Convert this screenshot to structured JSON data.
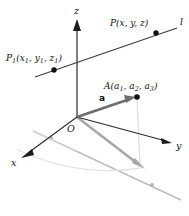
{
  "figure": {
    "colors": {
      "axis": "#2b2b2b",
      "line": "#3a3a3a",
      "vector": "#6e6e6e",
      "projection": "#b9b9b9",
      "projection_light": "#d8d8d8",
      "point": "#111111",
      "point_gray": "#b0b0b0",
      "background": "#ffffff"
    },
    "axes": [
      {
        "id": "x",
        "label": "x",
        "label_x": 12,
        "label_y": 163,
        "from": [
          77,
          117
        ],
        "to": [
          22,
          157
        ]
      },
      {
        "id": "y",
        "label": "y",
        "label_x": 176,
        "label_y": 148,
        "from": [
          77,
          117
        ],
        "to": [
          169,
          142
        ]
      },
      {
        "id": "z",
        "label": "z",
        "label_x": 74,
        "label_y": 10,
        "from": [
          77,
          117
        ],
        "to": [
          77,
          22
        ]
      }
    ],
    "origin": {
      "label": "O",
      "label_x": 67,
      "label_y": 131,
      "x": 77,
      "y": 117
    },
    "points": [
      {
        "id": "P1",
        "label": "P",
        "sub": "1",
        "args": "(x",
        "args_sub": "1",
        "args_mid": ", y",
        "args_sub2": "1",
        "args_mid2": ", z",
        "args_sub3": "1",
        "args_end": ")",
        "full_label": "P₁(x₁, y₁, z₁)",
        "label_x": 6,
        "label_y": 61,
        "x": 54,
        "y": 70,
        "color": "#111111"
      },
      {
        "id": "P",
        "label": "P",
        "full_label": "P(x, y, z)",
        "label_x": 110,
        "label_y": 26,
        "x": 156,
        "y": 33,
        "color": "#111111"
      },
      {
        "id": "A",
        "label": "A",
        "full_label": "A(a₁, a₂, a₃)",
        "label_x": 104,
        "label_y": 89,
        "x": 137,
        "y": 97,
        "color": "#111111"
      }
    ],
    "line_l": {
      "label": "l",
      "label_x": 180,
      "label_y": 25,
      "from": [
        35,
        77
      ],
      "to": [
        177,
        28
      ]
    },
    "vector_a": {
      "label": "a",
      "label_x": 99,
      "label_y": 100,
      "from": [
        77,
        117
      ],
      "to": [
        134,
        98
      ]
    },
    "projections": {
      "vector_shadow_from": [
        77,
        117
      ],
      "vector_shadow_to": [
        142,
        167
      ],
      "line_shadow_from": [
        33,
        131
      ],
      "line_shadow_to": [
        181,
        200
      ],
      "line_shadow_dots": [
        [
          51,
          138
        ],
        [
          152,
          185
        ]
      ],
      "vertical_drop_from": [
        137,
        97
      ],
      "vertical_drop_to": [
        140,
        166
      ],
      "floor_curve": "M 20,152 Q 80,176 142,168"
    }
  }
}
